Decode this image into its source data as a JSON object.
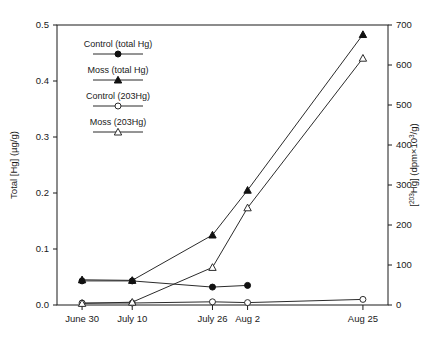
{
  "chart_data": {
    "type": "line",
    "title": "",
    "xlabel": "",
    "ylabel": "Total [Hg] (µg/g)",
    "ylabel_right_prefix": "[",
    "ylabel_right_sup": "203",
    "ylabel_right_rest": "Hg] (dpm×10",
    "ylabel_right_sup2": "3",
    "ylabel_right_tail": "/g)",
    "categories": [
      "June 30",
      "July 10",
      "July 26",
      "Aug 2",
      "Aug 25"
    ],
    "x_positions": [
      0,
      10,
      26,
      33,
      56
    ],
    "xlim": [
      -5,
      61
    ],
    "ylim": [
      0.0,
      0.5
    ],
    "ylim_right": [
      0,
      700
    ],
    "y_ticks": [
      "0.0",
      "0.1",
      "0.2",
      "0.3",
      "0.4",
      "0.5"
    ],
    "y_tick_values": [
      0.0,
      0.1,
      0.2,
      0.3,
      0.4,
      0.5
    ],
    "y_ticks_right": [
      "0",
      "100",
      "200",
      "300",
      "400",
      "500",
      "600",
      "700"
    ],
    "y_tick_values_right": [
      0,
      100,
      200,
      300,
      400,
      500,
      600,
      700
    ],
    "grid": false,
    "legend_position": "upper-left-inside",
    "series": [
      {
        "name": "Control (total Hg)",
        "axis": "left",
        "marker": "filled-circle",
        "x": [
          "June 30",
          "July 10",
          "July 26",
          "Aug 2"
        ],
        "values": [
          0.043,
          0.043,
          0.032,
          0.035
        ]
      },
      {
        "name": "Moss (total Hg)",
        "axis": "left",
        "marker": "filled-triangle",
        "x": [
          "June 30",
          "July 10",
          "July 26",
          "Aug 2",
          "Aug 25"
        ],
        "values": [
          0.045,
          0.044,
          0.125,
          0.205,
          0.483
        ]
      },
      {
        "name": "Control (203Hg)",
        "axis": "right",
        "marker": "open-circle",
        "x": [
          "June 30",
          "July 10",
          "July 26",
          "Aug 2",
          "Aug 25"
        ],
        "values": [
          5,
          5,
          8,
          6,
          14
        ]
      },
      {
        "name": "Moss (203Hg)",
        "axis": "right",
        "marker": "open-triangle",
        "x": [
          "June 30",
          "July 10",
          "July 26",
          "Aug 2",
          "Aug 25"
        ],
        "values": [
          4,
          7,
          94,
          243,
          617
        ]
      }
    ]
  },
  "legend": {
    "items": [
      {
        "label": "Control (total Hg)",
        "marker": "filled-circle"
      },
      {
        "label": "Moss (total Hg)",
        "marker": "filled-triangle"
      },
      {
        "label": "Control (203Hg)",
        "marker": "open-circle"
      },
      {
        "label": "Moss (203Hg)",
        "marker": "open-triangle"
      }
    ]
  },
  "colors": {
    "axis": "#1a1a1a",
    "line": "#2b2b2b",
    "marker_fill": "#111111",
    "marker_open": "#ffffff",
    "background": "#ffffff"
  }
}
